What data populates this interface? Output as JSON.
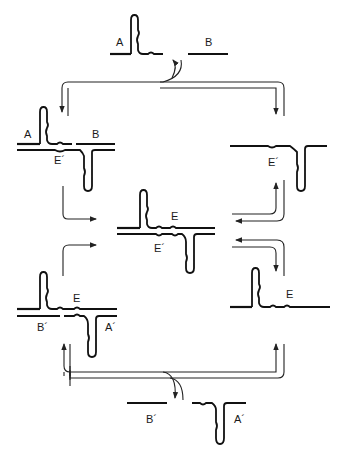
{
  "figure": {
    "type": "replication-cycle-diagram",
    "colors": {
      "ink": "#111111",
      "background": "#ffffff"
    },
    "molecules": {
      "top_substrates": {
        "left_label": "A",
        "right_label": "B"
      },
      "upper_left": {
        "label_a": "A",
        "label_b": "B",
        "label_template": "E´"
      },
      "upper_right": {
        "label_template": "E´"
      },
      "center": {
        "label_top": "E",
        "label_bottom": "E´"
      },
      "lower_left": {
        "label_top": "E",
        "label_b": "B´",
        "label_a": "A´"
      },
      "lower_right": {
        "label_top": "E"
      },
      "bottom_substrates": {
        "left_label": "B´",
        "right_label": "A´"
      }
    },
    "arrows": [
      "substrates-to-upper-left",
      "substrates-to-upper-right",
      "upper-left-to-center",
      "upper-right-from-center",
      "center-to-lower-right",
      "lower-left-to-center",
      "bottom-substrates-to-lower-left",
      "bottom-substrates-to-lower-right"
    ]
  }
}
